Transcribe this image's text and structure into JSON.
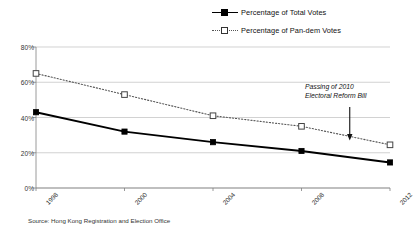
{
  "chart_data": {
    "type": "line",
    "title": "",
    "subtitle": "",
    "xlabel": "",
    "ylabel": "",
    "categories": [
      "1998",
      "2000",
      "2004",
      "2008",
      "2012"
    ],
    "series": [
      {
        "name": "Percentage of Total Votes",
        "values": [
          43,
          32,
          26,
          21,
          14.5
        ],
        "marker": "filled-square",
        "line_style": "solid",
        "color": "#000000"
      },
      {
        "name": "Percentage of Pan-dem Votes",
        "values": [
          65,
          53,
          41,
          35,
          24.5
        ],
        "marker": "open-square",
        "line_style": "dotted",
        "color": "#555555"
      }
    ],
    "ylim": [
      0,
      80
    ],
    "yticks": [
      0,
      20,
      40,
      60,
      80
    ],
    "ytick_labels": [
      "0%",
      "20%",
      "40%",
      "60%",
      "80%"
    ],
    "grid": "horizontal",
    "legend_position": "top-right",
    "annotations": [
      {
        "text_line_1": "Passing of 2010",
        "text_line_2": "Electoral Reform Bill",
        "arrow": "down",
        "points_to_x": "between 2008 and 2012"
      }
    ]
  },
  "legend": {
    "items": [
      {
        "label": "Percentage of Total Votes",
        "key": "solid-filled-square-key"
      },
      {
        "label": "Percentage of Pan-dem Votes",
        "key": "dotted-open-square-key"
      }
    ]
  },
  "footer": {
    "source": "Source: Hong Kong Registration and Election Office"
  }
}
